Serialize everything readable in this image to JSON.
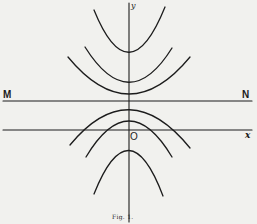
{
  "figure": {
    "caption": "Fig. 1.",
    "labels": {
      "M": "M",
      "N": "N",
      "origin": "O",
      "x_axis": "x",
      "y_axis": "y"
    },
    "colors": {
      "background": "#f1f1ee",
      "ink": "#1c1c1c"
    },
    "lines": [
      {
        "name": "y-axis",
        "from": [
          129,
          3
        ],
        "to": [
          129,
          222
        ]
      },
      {
        "name": "line-MN",
        "from": [
          3,
          101
        ],
        "to": [
          252,
          101
        ]
      },
      {
        "name": "x-axis",
        "from": [
          3,
          130
        ],
        "to": [
          252,
          130
        ]
      }
    ],
    "curves": [
      {
        "name": "upper-parabola-1",
        "opens": "up",
        "vertex": [
          129,
          53
        ],
        "left_end": [
          94,
          10
        ],
        "right_end": [
          165,
          7
        ]
      },
      {
        "name": "upper-parabola-2",
        "opens": "up",
        "vertex": [
          129,
          82
        ],
        "left_end": [
          85,
          47
        ],
        "right_end": [
          172,
          48
        ]
      },
      {
        "name": "upper-parabola-3",
        "opens": "up",
        "vertex": [
          129,
          94
        ],
        "left_end": [
          68,
          57
        ],
        "right_end": [
          190,
          57
        ]
      },
      {
        "name": "lower-arc-1",
        "opens": "down",
        "vertex": [
          129,
          109
        ],
        "left_end": [
          70,
          145
        ],
        "right_end": [
          190,
          148
        ]
      },
      {
        "name": "lower-arc-2",
        "opens": "down",
        "vertex": [
          129,
          121
        ],
        "left_end": [
          86,
          157
        ],
        "right_end": [
          172,
          157
        ]
      },
      {
        "name": "lower-parabola-3",
        "opens": "down",
        "vertex": [
          129,
          150
        ],
        "left_end": [
          94,
          194
        ],
        "right_end": [
          163,
          196
        ]
      }
    ]
  }
}
